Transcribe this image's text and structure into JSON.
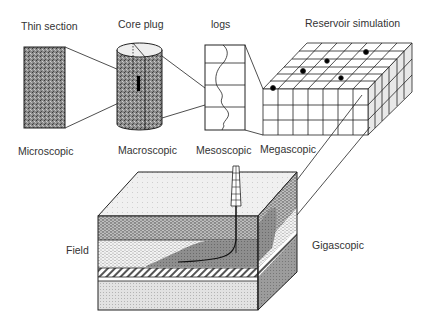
{
  "figure": {
    "title_labels": {
      "thin_section": "Thin section",
      "core_plug": "Core plug",
      "logs": "logs",
      "reservoir_simulation": "Reservoir simulation"
    },
    "scale_labels": {
      "microscopic": "Microscopic",
      "macroscopic": "Macroscopic",
      "mesoscopic": "Mesoscopic",
      "megascopic": "Megascopic",
      "field": "Field",
      "gigascopic": "Gigascopic"
    },
    "colors": {
      "line": "#222222",
      "stipple_dark": "#6e6e6e",
      "stipple_mid": "#9a9a9a",
      "stipple_light": "#d8d8d8",
      "plume": "#8a8a8a"
    }
  }
}
